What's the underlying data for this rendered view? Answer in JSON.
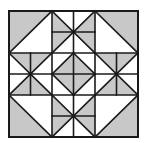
{
  "figure": {
    "title": "",
    "type": "quilt-block-pattern",
    "grid": {
      "rows": 3,
      "cols": 3
    },
    "colors": {
      "background": "#ffffff",
      "fill": "#c8c8c8",
      "line": "#1a1a1a"
    },
    "bounds": {
      "x0": 9,
      "y0": 11,
      "x1": 138,
      "y1": 137
    },
    "blocks": [
      {
        "row": 0,
        "col": 0,
        "kind": "half-square",
        "diagonal": "bl-tr",
        "shaded": "top-left"
      },
      {
        "row": 0,
        "col": 1,
        "kind": "star-8",
        "shaded": "horizontal-bowtie"
      },
      {
        "row": 0,
        "col": 2,
        "kind": "half-square",
        "diagonal": "tl-br",
        "shaded": "top-right"
      },
      {
        "row": 1,
        "col": 0,
        "kind": "star-8",
        "shaded": "vertical-bowtie"
      },
      {
        "row": 1,
        "col": 1,
        "kind": "diamond-in-square",
        "shaded": "diamond"
      },
      {
        "row": 1,
        "col": 2,
        "kind": "star-8",
        "shaded": "vertical-bowtie"
      },
      {
        "row": 2,
        "col": 0,
        "kind": "half-square",
        "diagonal": "tl-br",
        "shaded": "bottom-left"
      },
      {
        "row": 2,
        "col": 1,
        "kind": "star-8",
        "shaded": "horizontal-bowtie"
      },
      {
        "row": 2,
        "col": 2,
        "kind": "half-square",
        "diagonal": "bl-tr",
        "shaded": "bottom-right"
      }
    ]
  }
}
